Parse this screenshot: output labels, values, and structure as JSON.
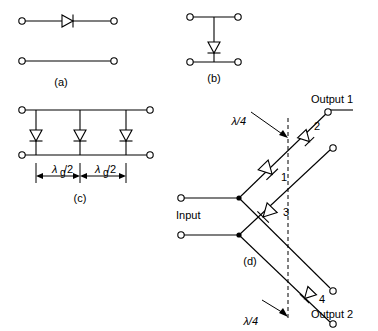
{
  "figure": {
    "title": "",
    "background": "#ffffff",
    "line_color": "#000000",
    "panels": [
      {
        "id": "a",
        "label": "(a)",
        "caption": "(a)"
      },
      {
        "id": "b",
        "label": "(b)",
        "caption": "(b)"
      },
      {
        "id": "c",
        "label": "(c)",
        "caption": "(c)"
      },
      {
        "id": "d",
        "label": "(d)",
        "caption": "(d)"
      }
    ]
  },
  "panel_a": {
    "caption": "(a)"
  },
  "panel_b": {
    "caption": "(b)"
  },
  "panel_c": {
    "caption": "(c)",
    "dimension_left": "λ",
    "dimension_left_sub": "g",
    "dimension_left_div": "/2",
    "dimension_right": "λ",
    "dimension_right_sub": "g",
    "dimension_right_div": "/2",
    "dimension_left_full": "λg/2",
    "dimension_right_full": "λg/2"
  },
  "panel_d": {
    "caption": "(d)",
    "input_label": "Input",
    "output1_label": "Output 1",
    "output2_label": "Output 2",
    "quarter_wave_top": "λ/4",
    "quarter_wave_bottom": "λ/4",
    "diode_numbers": [
      "1",
      "2",
      "3",
      "4"
    ]
  }
}
